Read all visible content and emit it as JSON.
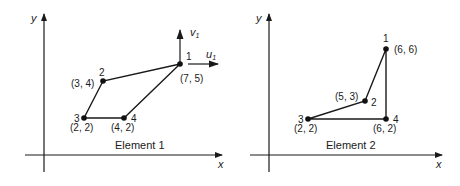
{
  "colors": {
    "ink": "#1a1a1a",
    "background": "#ffffff"
  },
  "panels": [
    {
      "title": "Element 1",
      "axes": {
        "x_label": "x",
        "y_label": "y"
      },
      "nodes": [
        {
          "id": "1",
          "coord": "(7, 5)"
        },
        {
          "id": "2",
          "coord": "(3, 4)"
        },
        {
          "id": "3",
          "coord": "(2, 2)"
        },
        {
          "id": "4",
          "coord": "(4, 2)"
        }
      ],
      "dof_arrows": {
        "vertical": "v",
        "vertical_sub": "1",
        "horizontal": "u",
        "horizontal_sub": "1"
      }
    },
    {
      "title": "Element 2",
      "axes": {
        "x_label": "x",
        "y_label": "y"
      },
      "nodes": [
        {
          "id": "1",
          "coord": "(6, 6)"
        },
        {
          "id": "2",
          "coord": "(5, 3)"
        },
        {
          "id": "3",
          "coord": "(2, 2)"
        },
        {
          "id": "4",
          "coord": "(6, 2)"
        }
      ]
    }
  ]
}
